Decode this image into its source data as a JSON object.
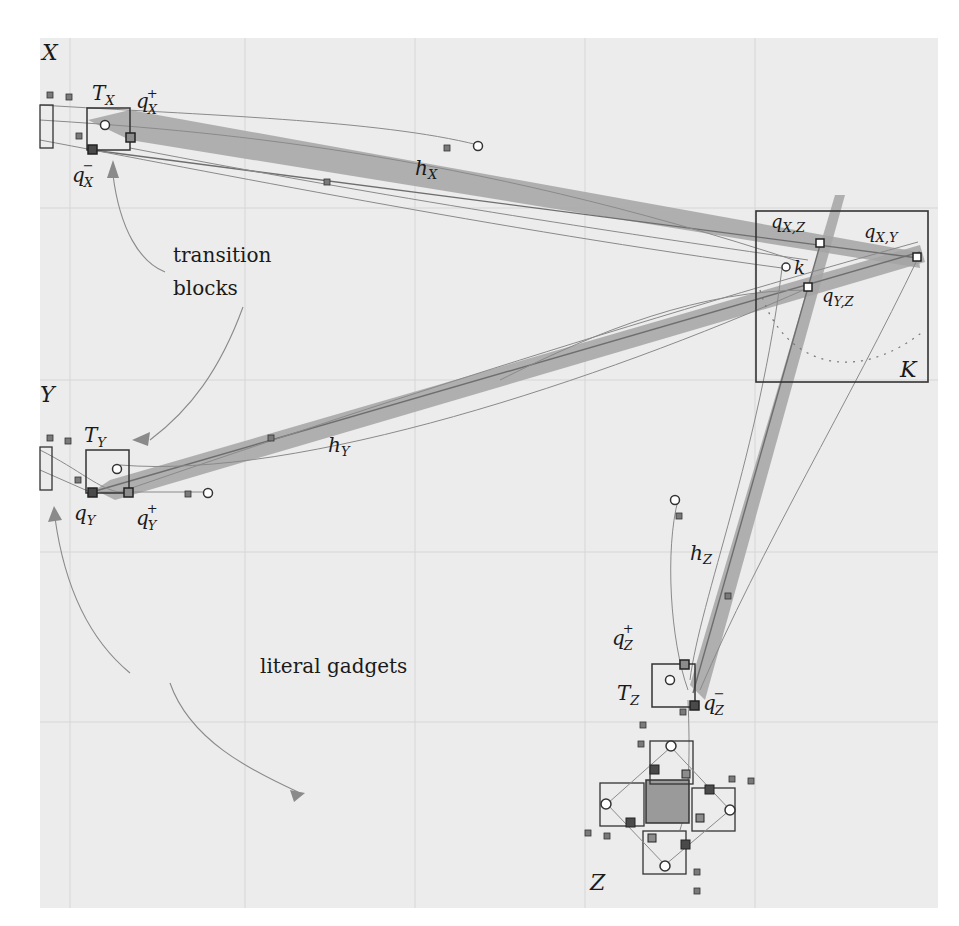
{
  "figure": {
    "gadgets": {
      "X": {
        "label": "X",
        "transition_block": "T",
        "transition_sub": "X",
        "q_plus": "q",
        "q_plus_sub": "X",
        "q_plus_sup": "+",
        "q_minus": "q",
        "q_minus_sub": "X",
        "q_minus_sup": "−",
        "wire": "h",
        "wire_sub": "X"
      },
      "Y": {
        "label": "Y",
        "transition_block": "T",
        "transition_sub": "Y",
        "q_plus": "q",
        "q_plus_sub": "Y",
        "q_plus_sup": "+",
        "q_minus": "q",
        "q_minus_sub": "Y",
        "q_minus_sup": "−",
        "wire": "h",
        "wire_sub": "Y"
      },
      "Z": {
        "label": "Z",
        "transition_block": "T",
        "transition_sub": "Z",
        "q_plus": "q",
        "q_plus_sub": "Z",
        "q_plus_sup": "+",
        "q_minus": "q",
        "q_minus_sub": "Z",
        "q_minus_sup": "−",
        "wire": "h",
        "wire_sub": "Z"
      }
    },
    "clause_gadget": {
      "label": "K",
      "center": "k",
      "q_xz": "q",
      "q_xz_sub": "X,Z",
      "q_xy": "q",
      "q_xy_sub": "X,Y",
      "q_yz": "q",
      "q_yz_sub": "Y,Z"
    },
    "annotations": {
      "transition_line1": "transition",
      "transition_line2": "blocks",
      "literal": "literal gadgets"
    },
    "colors": {
      "background": "#ececec",
      "grid": "#d8d8d8",
      "band": "#9a9a9a",
      "line": "#8a8a8a",
      "box": "#333333",
      "node_dark": "#4a4a4a",
      "node_light": "#8c8c8c"
    }
  }
}
